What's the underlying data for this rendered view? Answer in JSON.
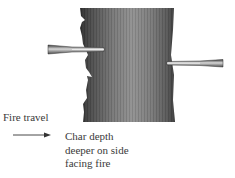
{
  "diagram": {
    "elements": {
      "post": {
        "shape": "vertical timber post",
        "left_edge": "deeply charred, irregular",
        "right_edge": "lightly charred, smoother"
      },
      "left_probe": {
        "shape": "tapered depth gauge",
        "inserted_from": "left",
        "insertion": "deep"
      },
      "right_probe": {
        "shape": "tapered depth gauge",
        "inserted_from": "right",
        "insertion": "shallow"
      },
      "arrow": {
        "direction": "right",
        "meaning": "fire travel direction"
      }
    },
    "labels": {
      "fire_travel": "Fire travel",
      "char_depth": [
        "Char depth",
        "deeper on side",
        "facing fire"
      ]
    },
    "colors": {
      "post_dark": "#3c3c3c",
      "post_light": "#8a8a8a",
      "text": "#3a3a3a",
      "background": "#ffffff"
    }
  }
}
